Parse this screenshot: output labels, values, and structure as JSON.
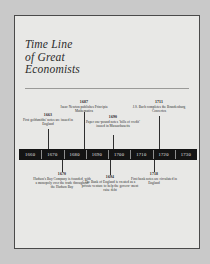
{
  "document": {
    "title_lines": [
      "Time Line",
      "of Great",
      "Economists"
    ]
  },
  "timeline": {
    "axis_ticks": [
      "1660",
      "1670",
      "1680",
      "1690",
      "1700",
      "1710",
      "1720",
      "1730"
    ],
    "axis_color": "#141414",
    "axis_label_color": "#e6e6e6",
    "page_background": "#e8e8e6",
    "border_color": "#4a4a4a",
    "events_above": [
      {
        "year": "1663",
        "text": "First goldsmiths' notes are issued in England"
      },
      {
        "year": "1687",
        "text": "Isaac Newton publishes Principia Mathematica"
      },
      {
        "year": "1690",
        "text": "Paper one-pound notes ‘bills of credit’ issued in Massachusetts"
      },
      {
        "year": "1711",
        "text": "J.S. Bach completes the Brandenburg Concertos"
      }
    ],
    "events_below": [
      {
        "year": "1670",
        "text": "Hudson's Bay Company is founded, with a monopoly over the trade throughout the Hudson Bay"
      },
      {
        "year": "1694",
        "text": "The Bank of England is created as a private venture to help the govern- ment raise debt"
      },
      {
        "year": "1718",
        "text": "First bank notes are circulated in England"
      }
    ]
  }
}
